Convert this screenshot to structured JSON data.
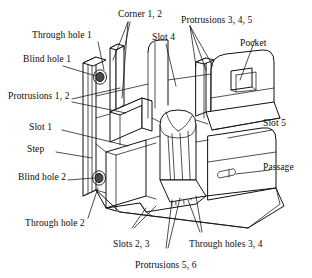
{
  "figure": {
    "background_color": "#ffffff",
    "line_color": "#111111",
    "text_color": "#0a0a0a",
    "width": 312,
    "height": 278
  },
  "labels": {
    "corner_1_2": "Corner 1, 2",
    "through_hole_1": "Through hole 1",
    "protrusions_3_4_5": "Protrusions 3, 4, 5",
    "slot_4": "Slot 4",
    "pocket": "Pocket",
    "blind_hole_1": "Blind hole 1",
    "protrusions_1_2": "Protrusions 1, 2",
    "slot_1": "Slot 1",
    "slot_5": "Slot 5",
    "step": "Step",
    "passage": "Passage",
    "blind_hole_2": "Blind hole 2",
    "through_hole_2": "Through hole 2",
    "slots_2_3": "Slots 2, 3",
    "through_holes_3_4": "Through holes 3, 4",
    "protrusions_5_6": "Protrusions 5, 6"
  },
  "feature_list": [
    "Corner 1, 2",
    "Through hole 1",
    "Protrusions 3, 4, 5",
    "Slot 4",
    "Pocket",
    "Blind hole 1",
    "Protrusions 1, 2",
    "Slot 1",
    "Slot 5",
    "Step",
    "Passage",
    "Blind hole 2",
    "Through hole 2",
    "Slots 2, 3",
    "Through holes 3, 4",
    "Protrusions 5, 6"
  ]
}
